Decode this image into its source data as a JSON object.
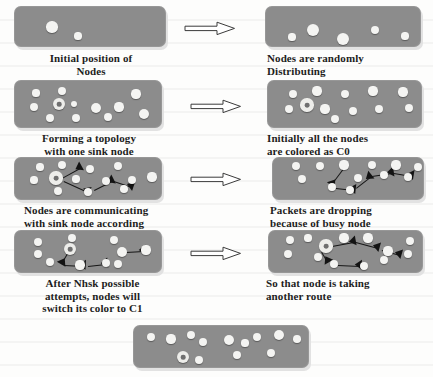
{
  "figure": {
    "background_color": "#fdfdfc",
    "panel_color": "#8c8c8c",
    "node_color": "#f4f4f2",
    "link_color": "#131313",
    "arrow_icon": "right-arrow-icon"
  },
  "steps": [
    {
      "id": "initial-position",
      "caption": "Initial position of\nNodes",
      "align": "center",
      "nodes": [
        {
          "x": 38,
          "y": 21,
          "r": 5.6
        },
        {
          "x": 64,
          "y": 30,
          "r": 3.6
        }
      ],
      "sink": null,
      "links": []
    },
    {
      "id": "random-distribution",
      "caption": "Nodes are randomly\nDistributing",
      "align": "left",
      "nodes": [
        {
          "x": 27,
          "y": 31,
          "r": 3.6
        },
        {
          "x": 48,
          "y": 24,
          "r": 6.0
        },
        {
          "x": 78,
          "y": 33,
          "r": 6.4
        },
        {
          "x": 110,
          "y": 24,
          "r": 4.2
        },
        {
          "x": 140,
          "y": 30,
          "r": 3.6
        }
      ],
      "sink": null,
      "links": []
    },
    {
      "id": "forming-topology",
      "caption": "Forming a topology\nwith one sink node",
      "align": "center",
      "nodes": [
        {
          "x": 22,
          "y": 13,
          "r": 3.6
        },
        {
          "x": 48,
          "y": 11,
          "r": 4.2
        },
        {
          "x": 122,
          "y": 14,
          "r": 4.6
        },
        {
          "x": 20,
          "y": 27,
          "r": 4.4
        },
        {
          "x": 60,
          "y": 24,
          "r": 3.4
        },
        {
          "x": 82,
          "y": 28,
          "r": 5.0
        },
        {
          "x": 105,
          "y": 27,
          "r": 4.6
        },
        {
          "x": 36,
          "y": 38,
          "r": 4.0
        },
        {
          "x": 62,
          "y": 38,
          "r": 4.0
        },
        {
          "x": 94,
          "y": 37,
          "r": 4.2
        },
        {
          "x": 130,
          "y": 34,
          "r": 5.0
        }
      ],
      "sink": {
        "x": 45,
        "y": 24,
        "r": 6.4
      },
      "links": []
    },
    {
      "id": "colored-c0",
      "caption": "Initially all the nodes\nare colored as C0",
      "align": "left",
      "nodes": [
        {
          "x": 26,
          "y": 14,
          "r": 4.0
        },
        {
          "x": 50,
          "y": 11,
          "r": 4.6
        },
        {
          "x": 78,
          "y": 14,
          "r": 4.2
        },
        {
          "x": 106,
          "y": 11,
          "r": 4.6
        },
        {
          "x": 136,
          "y": 12,
          "r": 4.6
        },
        {
          "x": 22,
          "y": 29,
          "r": 4.2
        },
        {
          "x": 58,
          "y": 29,
          "r": 4.6
        },
        {
          "x": 86,
          "y": 31,
          "r": 4.2
        },
        {
          "x": 112,
          "y": 29,
          "r": 4.0
        },
        {
          "x": 142,
          "y": 28,
          "r": 4.2
        },
        {
          "x": 68,
          "y": 39,
          "r": 4.0
        }
      ],
      "sink": {
        "x": 40,
        "y": 25,
        "r": 6.6
      },
      "links": []
    },
    {
      "id": "communicating-with-sink",
      "caption": "Nodes are communicating\nwith sink node according\nto their priority",
      "align": "left",
      "nodes": [
        {
          "x": 26,
          "y": 10,
          "r": 3.6
        },
        {
          "x": 48,
          "y": 8,
          "r": 4.2
        },
        {
          "x": 76,
          "y": 12,
          "r": 4.2
        },
        {
          "x": 104,
          "y": 9,
          "r": 4.4
        },
        {
          "x": 20,
          "y": 23,
          "r": 3.6
        },
        {
          "x": 62,
          "y": 22,
          "r": 3.6
        },
        {
          "x": 92,
          "y": 24,
          "r": 4.0
        },
        {
          "x": 118,
          "y": 23,
          "r": 4.4
        },
        {
          "x": 138,
          "y": 20,
          "r": 4.6
        },
        {
          "x": 44,
          "y": 34,
          "r": 4.4
        },
        {
          "x": 74,
          "y": 35,
          "r": 4.2
        },
        {
          "x": 110,
          "y": 32,
          "r": 3.8
        }
      ],
      "sink": {
        "x": 42,
        "y": 21,
        "r": 6.6
      },
      "links": [
        {
          "x1": 48,
          "y1": 21,
          "x2": 66,
          "y2": 11
        },
        {
          "x1": 50,
          "y1": 24,
          "x2": 74,
          "y2": 35
        },
        {
          "x1": 80,
          "y1": 33,
          "x2": 98,
          "y2": 24
        },
        {
          "x1": 100,
          "y1": 24,
          "x2": 118,
          "y2": 30
        }
      ]
    },
    {
      "id": "packets-dropping",
      "caption": "Packets are dropping\nbecause of busy node",
      "align": "left",
      "nodes": [
        {
          "x": 24,
          "y": 9,
          "r": 4.0
        },
        {
          "x": 48,
          "y": 9,
          "r": 4.2
        },
        {
          "x": 72,
          "y": 8,
          "r": 4.6
        },
        {
          "x": 100,
          "y": 8,
          "r": 4.2
        },
        {
          "x": 124,
          "y": 8,
          "r": 4.6
        },
        {
          "x": 146,
          "y": 10,
          "r": 4.2
        },
        {
          "x": 30,
          "y": 22,
          "r": 4.4
        },
        {
          "x": 86,
          "y": 21,
          "r": 4.0
        },
        {
          "x": 112,
          "y": 18,
          "r": 4.0
        },
        {
          "x": 136,
          "y": 20,
          "r": 4.2
        },
        {
          "x": 60,
          "y": 30,
          "r": 4.2
        },
        {
          "x": 78,
          "y": 33,
          "r": 4.0
        }
      ],
      "sink": null,
      "links": [
        {
          "x1": 72,
          "y1": 12,
          "x2": 60,
          "y2": 28
        },
        {
          "x1": 64,
          "y1": 31,
          "x2": 82,
          "y2": 33
        },
        {
          "x1": 84,
          "y1": 31,
          "x2": 98,
          "y2": 20
        },
        {
          "x1": 100,
          "y1": 19,
          "x2": 120,
          "y2": 16
        },
        {
          "x1": 122,
          "y1": 16,
          "x2": 140,
          "y2": 19
        }
      ]
    },
    {
      "id": "switch-color-c1",
      "caption": "After Nhsk possible\nattempts, nodes will\nswitch its color to C1",
      "align": "center",
      "nodes": [
        {
          "x": 24,
          "y": 12,
          "r": 4.0
        },
        {
          "x": 58,
          "y": 8,
          "r": 4.2
        },
        {
          "x": 100,
          "y": 10,
          "r": 4.0
        },
        {
          "x": 24,
          "y": 24,
          "r": 4.2
        },
        {
          "x": 36,
          "y": 32,
          "r": 4.0
        },
        {
          "x": 108,
          "y": 22,
          "r": 5.0
        },
        {
          "x": 132,
          "y": 20,
          "r": 4.6
        },
        {
          "x": 66,
          "y": 35,
          "r": 4.6
        },
        {
          "x": 92,
          "y": 33,
          "r": 4.2
        },
        {
          "x": 104,
          "y": 34,
          "r": 4.0
        }
      ],
      "sink": {
        "x": 56,
        "y": 19,
        "r": 6.4
      },
      "links": [
        {
          "x1": 54,
          "y1": 24,
          "x2": 48,
          "y2": 34
        },
        {
          "x1": 50,
          "y1": 35,
          "x2": 70,
          "y2": 36
        },
        {
          "x1": 74,
          "y1": 36,
          "x2": 92,
          "y2": 34
        },
        {
          "x1": 112,
          "y1": 22,
          "x2": 130,
          "y2": 21
        }
      ]
    },
    {
      "id": "another-route",
      "caption": "So that node is taking\nanother route",
      "align": "left",
      "nodes": [
        {
          "x": 22,
          "y": 10,
          "r": 4.0
        },
        {
          "x": 40,
          "y": 8,
          "r": 3.6
        },
        {
          "x": 76,
          "y": 8,
          "r": 4.6
        },
        {
          "x": 100,
          "y": 8,
          "r": 4.6
        },
        {
          "x": 142,
          "y": 11,
          "r": 4.0
        },
        {
          "x": 20,
          "y": 24,
          "r": 4.2
        },
        {
          "x": 120,
          "y": 21,
          "r": 4.6
        },
        {
          "x": 140,
          "y": 24,
          "r": 4.2
        },
        {
          "x": 50,
          "y": 27,
          "r": 4.0
        },
        {
          "x": 66,
          "y": 34,
          "r": 4.2
        },
        {
          "x": 96,
          "y": 36,
          "r": 4.0
        },
        {
          "x": 116,
          "y": 30,
          "r": 4.0
        }
      ],
      "sink": {
        "x": 58,
        "y": 16,
        "r": 6.6
      },
      "links": [
        {
          "x1": 64,
          "y1": 16,
          "x2": 86,
          "y2": 12
        },
        {
          "x1": 88,
          "y1": 12,
          "x2": 110,
          "y2": 18
        },
        {
          "x1": 114,
          "y1": 20,
          "x2": 132,
          "y2": 25
        },
        {
          "x1": 54,
          "y1": 22,
          "x2": 60,
          "y2": 32
        },
        {
          "x1": 70,
          "y1": 35,
          "x2": 92,
          "y2": 36
        }
      ]
    },
    {
      "id": "final-state",
      "caption": "",
      "align": "center",
      "nodes": [
        {
          "x": 18,
          "y": 12,
          "r": 4.4
        },
        {
          "x": 38,
          "y": 14,
          "r": 4.6
        },
        {
          "x": 58,
          "y": 10,
          "r": 4.0
        },
        {
          "x": 70,
          "y": 17,
          "r": 4.2
        },
        {
          "x": 96,
          "y": 15,
          "r": 5.0
        },
        {
          "x": 124,
          "y": 12,
          "r": 4.2
        },
        {
          "x": 146,
          "y": 10,
          "r": 5.2
        },
        {
          "x": 164,
          "y": 14,
          "r": 3.8
        },
        {
          "x": 112,
          "y": 18,
          "r": 3.6
        },
        {
          "x": 104,
          "y": 30,
          "r": 4.2
        },
        {
          "x": 138,
          "y": 28,
          "r": 4.2
        },
        {
          "x": 66,
          "y": 35,
          "r": 4.0
        }
      ],
      "sink": {
        "x": 50,
        "y": 32,
        "r": 6.4
      },
      "links": []
    }
  ],
  "arrows": [
    {
      "id": "arrow-row-1"
    },
    {
      "id": "arrow-row-2"
    },
    {
      "id": "arrow-row-3"
    },
    {
      "id": "arrow-row-4"
    }
  ]
}
